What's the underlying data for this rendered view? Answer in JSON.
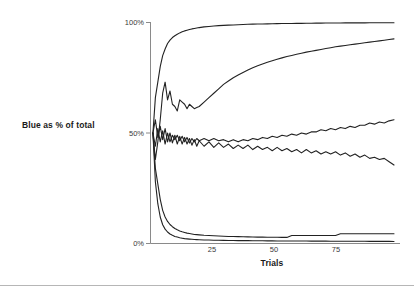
{
  "chart_data": {
    "type": "line",
    "title": "",
    "xlabel": "Trials",
    "ylabel": "Blue as % of total",
    "xlim": [
      0,
      100
    ],
    "ylim": [
      0,
      100
    ],
    "grid": false,
    "legend": false,
    "x_ticks": [
      25,
      50,
      75
    ],
    "x_tick_labels": [
      "25",
      "50",
      "75"
    ],
    "y_ticks": [
      0,
      50,
      100
    ],
    "y_tick_labels": [
      "0%",
      "50%",
      "100%"
    ],
    "line_color": "#222222",
    "axis_color": "#8a8a8a",
    "background": "#ffffff",
    "x": [
      1,
      2,
      3,
      4,
      5,
      6,
      7,
      8,
      9,
      10,
      11,
      12,
      13,
      14,
      15,
      16,
      17,
      18,
      19,
      20,
      22,
      24,
      26,
      28,
      30,
      32,
      34,
      36,
      38,
      40,
      42,
      44,
      46,
      48,
      50,
      52,
      54,
      56,
      58,
      60,
      62,
      64,
      66,
      68,
      70,
      72,
      74,
      76,
      78,
      80,
      82,
      84,
      86,
      88,
      90,
      92,
      94,
      96,
      98,
      100
    ],
    "series": [
      {
        "name": "run-1-converges-high",
        "values": [
          50,
          66,
          73,
          80,
          85,
          88,
          90.5,
          92,
          93.2,
          94,
          94.7,
          95.3,
          95.8,
          96.2,
          96.5,
          96.8,
          97.1,
          97.3,
          97.5,
          97.7,
          98,
          98.2,
          98.4,
          98.6,
          98.7,
          98.8,
          98.9,
          99,
          99.1,
          99.2,
          99.25,
          99.3,
          99.35,
          99.4,
          99.45,
          99.5,
          99.52,
          99.55,
          99.58,
          99.6,
          99.62,
          99.65,
          99.67,
          99.7,
          99.72,
          99.74,
          99.76,
          99.78,
          99.8,
          99.81,
          99.82,
          99.83,
          99.84,
          99.85,
          99.86,
          99.87,
          99.88,
          99.89,
          99.9,
          99.9
        ]
      },
      {
        "name": "run-2-rises-slowly",
        "values": [
          50,
          38,
          46,
          56,
          68,
          73,
          65,
          69,
          63,
          62,
          60,
          65,
          64,
          63,
          61,
          63,
          62,
          61,
          61.5,
          62,
          64,
          66,
          68,
          70,
          72,
          73.5,
          75,
          76.2,
          77.4,
          78.5,
          79.5,
          80.4,
          81.2,
          82,
          82.7,
          83.4,
          84,
          84.6,
          85.1,
          85.6,
          86.1,
          86.6,
          87,
          87.4,
          87.8,
          88.2,
          88.6,
          89,
          89.3,
          89.6,
          89.9,
          90.2,
          90.5,
          90.8,
          91.1,
          91.4,
          91.7,
          92,
          92.3,
          92.6
        ]
      },
      {
        "name": "run-3-hovers-rising",
        "values": [
          50,
          44,
          52,
          46,
          51,
          45,
          50,
          46,
          49,
          47,
          49,
          46.5,
          48.5,
          46,
          48,
          45.5,
          47.5,
          46,
          47.5,
          46.5,
          47.5,
          46.5,
          47.5,
          46.5,
          47,
          46,
          47,
          46,
          47,
          46.5,
          47.5,
          47,
          48,
          47.5,
          48.5,
          48,
          49,
          48.5,
          49.5,
          49,
          50,
          49.5,
          50.5,
          50.5,
          51.5,
          51,
          52,
          51.5,
          52.5,
          52,
          53,
          52.5,
          53.5,
          53.5,
          54.5,
          54,
          55,
          54.5,
          55.5,
          56
        ]
      },
      {
        "name": "run-4-hovers-falling",
        "values": [
          50,
          56,
          48,
          53,
          47,
          52,
          46,
          50,
          45.5,
          49,
          45,
          48.5,
          45,
          48,
          45,
          47.5,
          44.5,
          47,
          44,
          46.5,
          44,
          46,
          43.5,
          45.5,
          43.5,
          45,
          43,
          44.5,
          43,
          44.5,
          42.5,
          44,
          42.5,
          43.5,
          42,
          43.5,
          42,
          43,
          41.5,
          42.5,
          41,
          42.5,
          41,
          42,
          40.5,
          41.5,
          40.5,
          41.5,
          40,
          41,
          39.5,
          40.5,
          39,
          40,
          38.5,
          39,
          38,
          38.5,
          37,
          35.5
        ]
      },
      {
        "name": "run-5-declines",
        "values": [
          50,
          34,
          27,
          20,
          15,
          12,
          10,
          8.6,
          7.6,
          6.8,
          6.2,
          5.7,
          5.3,
          5,
          4.7,
          4.5,
          4.3,
          4.1,
          4,
          3.9,
          3.7,
          3.6,
          3.5,
          3.4,
          3.3,
          3.2,
          3.15,
          3.1,
          3.05,
          3,
          2.95,
          2.9,
          2.88,
          2.85,
          2.82,
          2.8,
          2.78,
          2.76,
          3.6,
          3.6,
          3.6,
          3.6,
          3.6,
          3.6,
          3.6,
          3.6,
          3.6,
          3.6,
          4.4,
          4.4,
          4.4,
          4.4,
          4.4,
          4.4,
          4.4,
          4.4,
          4.4,
          4.4,
          4.4,
          4.4
        ]
      },
      {
        "name": "run-6-declines-lowest",
        "values": [
          50,
          28,
          18,
          12,
          8.5,
          6.5,
          5.2,
          4.3,
          3.7,
          3.2,
          2.9,
          2.6,
          2.4,
          2.2,
          2.1,
          2,
          1.9,
          1.8,
          1.75,
          1.7,
          1.6,
          1.55,
          1.5,
          1.45,
          1.4,
          1.38,
          1.35,
          1.32,
          1.3,
          1.28,
          1.26,
          1.24,
          1.22,
          1.2,
          1.18,
          1.16,
          1.15,
          1.14,
          1.13,
          1.12,
          1.11,
          1.1,
          1.09,
          1.08,
          1.07,
          1.06,
          1.05,
          1.04,
          1.03,
          1.02,
          1.01,
          1.0,
          1.0,
          0.99,
          0.98,
          0.97,
          0.96,
          0.95,
          0.94,
          0.93
        ]
      }
    ]
  },
  "axes": {
    "y_label": "Blue as % of total",
    "x_label": "Trials",
    "y_ticks": [
      {
        "label": "100%",
        "value": 100
      },
      {
        "label": "50%",
        "value": 50
      },
      {
        "label": "0%",
        "value": 0
      }
    ],
    "x_ticks": [
      {
        "label": "25",
        "value": 25
      },
      {
        "label": "50",
        "value": 50
      },
      {
        "label": "75",
        "value": 75
      }
    ]
  }
}
